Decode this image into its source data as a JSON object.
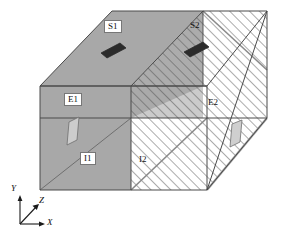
{
  "figure": {
    "kind": "3d-box-schematic",
    "background": "#ffffff",
    "line_color": "#4a4a4a",
    "colors": {
      "solid_face_gray": "#a8a8a8",
      "solid_face_gray_dark": "#9b9b9b",
      "hatch_line": "#6b6b6b",
      "hatch_background": "#ffffff",
      "patch_dark": "#2b2b2b",
      "patch_light": "#cccccc",
      "outline": "#4a4a4a",
      "label_text": "#111111",
      "label_box_fill": "#ffffff",
      "label_box_border": "#777777"
    }
  },
  "labels": {
    "top_left_source": {
      "text": "S1",
      "boxed": true,
      "x": 107,
      "y": 23
    },
    "top_right_source": {
      "text": "S2",
      "boxed": false,
      "x": 192,
      "y": 24
    },
    "left_face_outlet": {
      "text": "E1",
      "boxed": true,
      "x": 67,
      "y": 96
    },
    "right_face_outlet": {
      "text": "E2",
      "boxed": false,
      "x": 210,
      "y": 100
    },
    "front_left_inlet": {
      "text": "I1",
      "boxed": true,
      "x": 83,
      "y": 155
    },
    "front_right_inlet": {
      "text": "I2",
      "boxed": false,
      "x": 141,
      "y": 157
    }
  },
  "axes": {
    "origin": {
      "x": 20,
      "y": 224
    },
    "x_axis": {
      "label": "X",
      "label_x": 46,
      "label_y": 219,
      "tip_x": 42,
      "tip_y": 224
    },
    "y_axis": {
      "label": "Y",
      "label_x": 13,
      "label_y": 186,
      "tip_x": 20,
      "tip_y": 198
    },
    "z_axis": {
      "label": "Z",
      "label_x": 40,
      "label_y": 198,
      "tip_x": 38,
      "tip_y": 206
    }
  },
  "geometry": {
    "front_bottom_left": {
      "x": 40,
      "y": 190
    },
    "front_top_left": {
      "x": 40,
      "y": 86
    },
    "front_bottom_right": {
      "x": 207,
      "y": 190
    },
    "front_top_right": {
      "x": 207,
      "y": 86
    },
    "back_top_left": {
      "x": 112,
      "y": 11
    },
    "back_top_right": {
      "x": 267,
      "y": 11
    },
    "back_bottom_right": {
      "x": 267,
      "y": 118
    },
    "mid_top_front": {
      "x": 131,
      "y": 86
    },
    "mid_top_back": {
      "x": 203,
      "y": 11
    },
    "mid_front_vertical_x": 131,
    "front_split_x": 131,
    "front_mid_horizontal_y": 118
  },
  "patches": {
    "source_patch_1": {
      "kind": "dark-parallelogram",
      "cx": 113,
      "cy": 50
    },
    "source_patch_2": {
      "kind": "dark-parallelogram",
      "cx": 196,
      "cy": 49
    },
    "outlet_patch_1": {
      "kind": "light-parallelogram",
      "cx": 73,
      "cy": 130
    },
    "outlet_patch_2": {
      "kind": "light-parallelogram",
      "cx": 236,
      "cy": 133
    }
  },
  "regions": [
    {
      "name": "top-face-left-solid",
      "fill": "solid-gray"
    },
    {
      "name": "top-face-right-hatched",
      "fill": "hatched"
    },
    {
      "name": "front-face-left-solid",
      "fill": "solid-gray"
    },
    {
      "name": "front-face-right-hatched",
      "fill": "hatched"
    },
    {
      "name": "side-face-right-hatched",
      "fill": "hatched"
    },
    {
      "name": "interior-band-hatched",
      "fill": "hatched"
    }
  ]
}
